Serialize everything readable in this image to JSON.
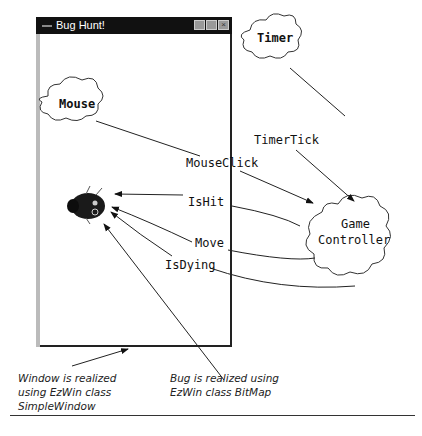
{
  "window": {
    "title": "Bug Hunt!",
    "controls": [
      "minimize",
      "maximize",
      "close"
    ]
  },
  "diagram": {
    "nodes": {
      "timer": "Timer",
      "mouse": "Mouse",
      "controller_line1": "Game",
      "controller_line2": "Controller",
      "bug": "bug-bitmap"
    },
    "edges": {
      "timer_tick": "TimerTick",
      "mouse_click": "MouseClick",
      "is_hit": "IsHit",
      "move": "Move",
      "is_dying": "IsDying"
    },
    "captions": {
      "window_line1": "Window is realized",
      "window_line2": "using EzWin class",
      "window_line3": "SimpleWindow",
      "bug_line1": "Bug is realized using",
      "bug_line2": "EzWin class BitMap"
    }
  }
}
